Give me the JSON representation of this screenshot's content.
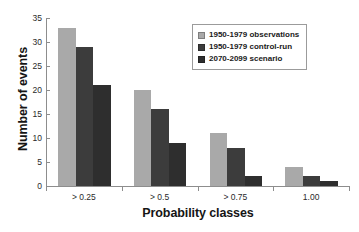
{
  "chart_data": {
    "type": "bar",
    "title": "",
    "xlabel": "Probability classes",
    "ylabel": "Number of events",
    "categories": [
      "> 0.25",
      "> 0.5",
      "> 0.75",
      "1.00"
    ],
    "series": [
      {
        "name": "1950-1979 observations",
        "color": "#a9a9a9",
        "values": [
          33,
          20,
          11,
          4
        ]
      },
      {
        "name": "1950-1979 control-run",
        "color": "#3c3c3c",
        "values": [
          29,
          16,
          8,
          2
        ]
      },
      {
        "name": "2070-2099 scenario",
        "color": "#2e2e2e",
        "values": [
          21,
          9,
          2,
          1
        ]
      }
    ],
    "ylim": [
      0,
      35
    ],
    "yticks": [
      0,
      5,
      10,
      15,
      20,
      25,
      30,
      35
    ],
    "grid": false,
    "legend_position": "top-right",
    "axis_color": "#8d8d8d"
  }
}
